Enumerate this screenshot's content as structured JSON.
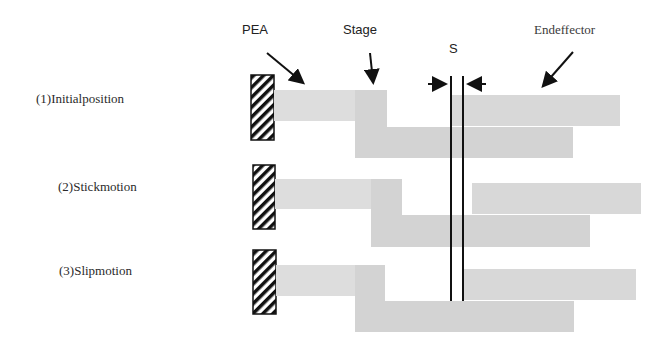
{
  "figure": {
    "type": "stick-slip mechanism schematic",
    "colors": {
      "pea_bar": "#dddddd",
      "stage": "#d3d3d3",
      "end_effector": "#d8d8d8",
      "hatch_stroke": "#111111",
      "line": "#111111",
      "text": "#222222"
    }
  },
  "callouts": {
    "pea": "PEA",
    "stage": "Stage",
    "gap": "S",
    "end_effector": "Endeffector"
  },
  "rows": [
    {
      "label": "(1)Initialposition"
    },
    {
      "label": "(2)Stickmotion"
    },
    {
      "label": "(3)Slipmotion"
    }
  ]
}
